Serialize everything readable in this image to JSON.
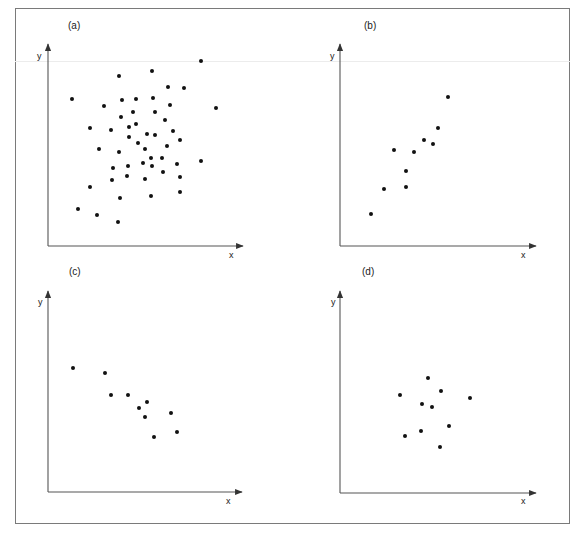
{
  "figure": {
    "frame": {
      "x": 15,
      "y": 8,
      "width": 555,
      "height": 516
    },
    "colors": {
      "dot": "#111111",
      "axis": "#555555",
      "frame": "#7a7a7a",
      "text": "#1a1a1a"
    }
  },
  "chart_data": [
    {
      "type": "scatter",
      "title": "(a)",
      "xlabel": "x",
      "ylabel": "y",
      "grid": false,
      "description": "No correlation — large diffuse cloud",
      "origin_px": [
        48,
        246
      ],
      "x_axis_end_px": 243,
      "y_axis_top_px": 44,
      "points_px": [
        [
          201,
          61
        ],
        [
          152,
          71
        ],
        [
          119,
          76
        ],
        [
          168,
          87
        ],
        [
          184,
          88
        ],
        [
          72,
          99
        ],
        [
          122,
          100
        ],
        [
          136,
          99
        ],
        [
          153,
          98
        ],
        [
          104,
          106
        ],
        [
          170,
          105
        ],
        [
          216,
          108
        ],
        [
          121,
          117
        ],
        [
          133,
          112
        ],
        [
          155,
          112
        ],
        [
          165,
          120
        ],
        [
          90,
          128
        ],
        [
          111,
          130
        ],
        [
          129,
          127
        ],
        [
          136,
          124
        ],
        [
          129,
          137
        ],
        [
          147,
          134
        ],
        [
          155,
          135
        ],
        [
          173,
          131
        ],
        [
          180,
          140
        ],
        [
          138,
          143
        ],
        [
          167,
          146
        ],
        [
          99,
          149
        ],
        [
          119,
          152
        ],
        [
          145,
          149
        ],
        [
          162,
          158
        ],
        [
          151,
          158
        ],
        [
          113,
          168
        ],
        [
          128,
          166
        ],
        [
          143,
          163
        ],
        [
          152,
          166
        ],
        [
          177,
          164
        ],
        [
          201,
          161
        ],
        [
          163,
          172
        ],
        [
          112,
          180
        ],
        [
          127,
          176
        ],
        [
          145,
          179
        ],
        [
          180,
          177
        ],
        [
          90,
          187
        ],
        [
          120,
          198
        ],
        [
          151,
          196
        ],
        [
          180,
          192
        ],
        [
          78,
          209
        ],
        [
          97,
          215
        ],
        [
          118,
          222
        ]
      ]
    },
    {
      "type": "scatter",
      "title": "(b)",
      "xlabel": "x",
      "ylabel": "y",
      "grid": false,
      "description": "Positive correlation",
      "origin_px": [
        340,
        246
      ],
      "x_axis_end_px": 536,
      "y_axis_top_px": 44,
      "points_px": [
        [
          448,
          97
        ],
        [
          438,
          128
        ],
        [
          424,
          140
        ],
        [
          433,
          144
        ],
        [
          394,
          150
        ],
        [
          414,
          152
        ],
        [
          406,
          171
        ],
        [
          406,
          187
        ],
        [
          384,
          189
        ],
        [
          371,
          214
        ]
      ]
    },
    {
      "type": "scatter",
      "title": "(c)",
      "xlabel": "x",
      "ylabel": "y",
      "grid": false,
      "description": "Negative correlation",
      "origin_px": [
        48,
        492
      ],
      "x_axis_end_px": 242,
      "y_axis_top_px": 291,
      "points_px": [
        [
          73,
          368
        ],
        [
          105,
          373
        ],
        [
          111,
          395
        ],
        [
          128,
          395
        ],
        [
          139,
          408
        ],
        [
          147,
          402
        ],
        [
          145,
          417
        ],
        [
          171,
          413
        ],
        [
          154,
          437
        ],
        [
          177,
          432
        ]
      ]
    },
    {
      "type": "scatter",
      "title": "(d)",
      "xlabel": "x",
      "ylabel": "y",
      "grid": false,
      "description": "No correlation — small tight cluster",
      "origin_px": [
        340,
        493
      ],
      "x_axis_end_px": 536,
      "y_axis_top_px": 291,
      "points_px": [
        [
          428,
          378
        ],
        [
          441,
          391
        ],
        [
          400,
          395
        ],
        [
          470,
          398
        ],
        [
          422,
          404
        ],
        [
          432,
          407
        ],
        [
          449,
          426
        ],
        [
          421,
          431
        ],
        [
          405,
          436
        ],
        [
          440,
          447
        ]
      ]
    }
  ],
  "panels": [
    {
      "label": "(a)",
      "label_pos": [
        68,
        29
      ],
      "x_label": "x",
      "y_label": "y",
      "x_label_pos": [
        229,
        258
      ],
      "y_label_pos": [
        37,
        59
      ]
    },
    {
      "label": "(b)",
      "label_pos": [
        364,
        29
      ],
      "x_label": "x",
      "y_label": "y",
      "x_label_pos": [
        521,
        258
      ],
      "y_label_pos": [
        330,
        59
      ]
    },
    {
      "label": "(c)",
      "label_pos": [
        69,
        275
      ],
      "x_label": "x",
      "y_label": "y",
      "x_label_pos": [
        226,
        504
      ],
      "y_label_pos": [
        38,
        305
      ]
    },
    {
      "label": "(d)",
      "label_pos": [
        362,
        275
      ],
      "x_label": "x",
      "y_label": "y",
      "x_label_pos": [
        521,
        504
      ],
      "y_label_pos": [
        331,
        305
      ]
    }
  ]
}
